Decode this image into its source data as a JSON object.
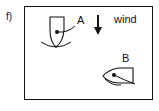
{
  "figure": {
    "panel_label": "f)",
    "boat_a_label": "A",
    "boat_b_label": "B",
    "wind_label": "wind",
    "icons": [
      "wind-arrow-down",
      "boat-a",
      "boat-b"
    ]
  }
}
